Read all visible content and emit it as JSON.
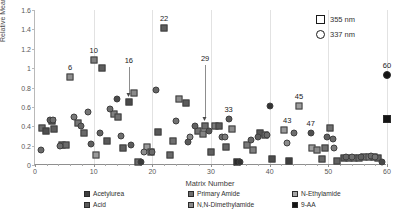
{
  "chart_data": {
    "type": "scatter",
    "title": "",
    "xlabel": "Matrix Number",
    "ylabel": "Relative Mean S/N Ratio",
    "xlim": [
      0,
      60
    ],
    "ylim": [
      0,
      1.6
    ],
    "xticks": [
      0,
      10,
      20,
      30,
      40,
      50,
      60
    ],
    "yticks": [
      "0",
      "0.2",
      "0.4",
      "0.6",
      "0.8",
      "1",
      "1.2",
      "1.4",
      "1.6"
    ],
    "grid": "vertical",
    "legend_position": "bottom",
    "wavelength_legend": [
      {
        "label": "355 nm",
        "marker": "square-open"
      },
      {
        "label": "337 nm",
        "marker": "circle-open"
      }
    ],
    "series": [
      {
        "name": "Acetylurea",
        "marker": "square",
        "color": "#3f3f3f"
      },
      {
        "name": "Acid",
        "marker": "square",
        "color": "#595959"
      },
      {
        "name": "Primary Amide",
        "marker": "square",
        "color": "#6e6e6e"
      },
      {
        "name": "N,N-Dimethylamide",
        "marker": "square",
        "color": "#8a8a8a"
      },
      {
        "name": "N-Ethylamide",
        "marker": "square",
        "color": "#a6a6a6"
      },
      {
        "name": "9-AA",
        "marker": "square",
        "color": "#141414"
      }
    ],
    "annotations": [
      {
        "label": "6",
        "x": 6,
        "y": 0.91
      },
      {
        "label": "10",
        "x": 10,
        "y": 1.08
      },
      {
        "label": "16",
        "x": 16,
        "y": 0.655
      },
      {
        "label": "22",
        "x": 22,
        "y": 1.41
      },
      {
        "label": "29",
        "x": 29,
        "y": 0.4
      },
      {
        "label": "33",
        "x": 33,
        "y": 0.47
      },
      {
        "label": "43",
        "x": 43,
        "y": 0.36
      },
      {
        "label": "45",
        "x": 45,
        "y": 0.61
      },
      {
        "label": "47",
        "x": 47,
        "y": 0.33
      },
      {
        "label": "60",
        "x": 60,
        "y": 0.93
      }
    ],
    "points_355nm": [
      {
        "x": 1.2,
        "y": 0.38,
        "c": "#6e6e6e"
      },
      {
        "x": 1.9,
        "y": 0.35,
        "c": "#4f4f4f"
      },
      {
        "x": 2.9,
        "y": 0.455,
        "c": "#555555"
      },
      {
        "x": 3.3,
        "y": 0.375,
        "c": "#5c5c5c"
      },
      {
        "x": 4.6,
        "y": 0.205,
        "c": "#5a5a5a"
      },
      {
        "x": 5.2,
        "y": 0.205,
        "c": "#6a6a6a"
      },
      {
        "x": 6.0,
        "y": 0.91,
        "c": "#8f8f8f"
      },
      {
        "x": 7.3,
        "y": 0.435,
        "c": "#777777"
      },
      {
        "x": 8.3,
        "y": 0.335,
        "c": "#696969"
      },
      {
        "x": 10.0,
        "y": 1.08,
        "c": "#808080"
      },
      {
        "x": 11.5,
        "y": 1.0,
        "c": "#5e5e5e"
      },
      {
        "x": 10.4,
        "y": 0.1,
        "c": "#9a9a9a"
      },
      {
        "x": 13.4,
        "y": 0.525,
        "c": "#808080"
      },
      {
        "x": 14.1,
        "y": 0.495,
        "c": "#707070"
      },
      {
        "x": 16.0,
        "y": 0.655,
        "c": "#4a4a4a"
      },
      {
        "x": 16.8,
        "y": 0.745,
        "c": "#8a8a8a"
      },
      {
        "x": 12.3,
        "y": 0.245,
        "c": "#5a5a5a"
      },
      {
        "x": 15.0,
        "y": 0.175,
        "c": "#606060"
      },
      {
        "x": 17.6,
        "y": 0.035,
        "c": "#6b6b6b"
      },
      {
        "x": 19.1,
        "y": 0.19,
        "c": "#9b9b9b"
      },
      {
        "x": 19.8,
        "y": 0.135,
        "c": "#6e6e6e"
      },
      {
        "x": 21.0,
        "y": 0.34,
        "c": "#585858"
      },
      {
        "x": 22.0,
        "y": 1.41,
        "c": "#5f5f5f"
      },
      {
        "x": 23.5,
        "y": 0.245,
        "c": "#707070"
      },
      {
        "x": 24.5,
        "y": 0.685,
        "c": "#8d8d8d"
      },
      {
        "x": 25.8,
        "y": 0.635,
        "c": "#5b5b5b"
      },
      {
        "x": 23.0,
        "y": 0.1,
        "c": "#6a6a6a"
      },
      {
        "x": 27.8,
        "y": 0.355,
        "c": "#737373"
      },
      {
        "x": 28.6,
        "y": 0.325,
        "c": "#838383"
      },
      {
        "x": 29.0,
        "y": 0.4,
        "c": "#6d6d6d"
      },
      {
        "x": 30.6,
        "y": 0.405,
        "c": "#7c7c7c"
      },
      {
        "x": 31.3,
        "y": 0.4,
        "c": "#5c5c5c"
      },
      {
        "x": 30.0,
        "y": 0.135,
        "c": "#606060"
      },
      {
        "x": 32.6,
        "y": 0.185,
        "c": "#666666"
      },
      {
        "x": 33.6,
        "y": 0.375,
        "c": "#8c8c8c"
      },
      {
        "x": 34.4,
        "y": 0.03,
        "c": "#2b2b2b"
      },
      {
        "x": 36.2,
        "y": 0.205,
        "c": "#7a7a7a"
      },
      {
        "x": 37.1,
        "y": 0.155,
        "c": "#808080"
      },
      {
        "x": 38.3,
        "y": 0.335,
        "c": "#555555"
      },
      {
        "x": 39.2,
        "y": 0.305,
        "c": "#6b6b6b"
      },
      {
        "x": 40.4,
        "y": 0.065,
        "c": "#4d4d4d"
      },
      {
        "x": 42.5,
        "y": 0.36,
        "c": "#9a9a9a"
      },
      {
        "x": 43.3,
        "y": 0.045,
        "c": "#3f3f3f"
      },
      {
        "x": 45.0,
        "y": 0.61,
        "c": "#9e9e9e"
      },
      {
        "x": 47.3,
        "y": 0.18,
        "c": "#a0a0a0"
      },
      {
        "x": 48.1,
        "y": 0.16,
        "c": "#8b8b8b"
      },
      {
        "x": 48.9,
        "y": 0.06,
        "c": "#686868"
      },
      {
        "x": 49.4,
        "y": 0.175,
        "c": "#6f6f6f"
      },
      {
        "x": 50.3,
        "y": 0.385,
        "c": "#707070"
      },
      {
        "x": 51.4,
        "y": 0.04,
        "c": "#626262"
      },
      {
        "x": 52.6,
        "y": 0.075,
        "c": "#5d5d5d"
      },
      {
        "x": 53.6,
        "y": 0.075,
        "c": "#6c6c6c"
      },
      {
        "x": 54.4,
        "y": 0.075,
        "c": "#777777"
      },
      {
        "x": 55.2,
        "y": 0.075,
        "c": "#6a6a6a"
      },
      {
        "x": 56.0,
        "y": 0.08,
        "c": "#737373"
      },
      {
        "x": 56.9,
        "y": 0.08,
        "c": "#7d7d7d"
      },
      {
        "x": 57.7,
        "y": 0.085,
        "c": "#686868"
      },
      {
        "x": 58.5,
        "y": 0.075,
        "c": "#606060"
      },
      {
        "x": 60.0,
        "y": 0.475,
        "c": "#141414"
      }
    ],
    "points_337nm": [
      {
        "x": 1.0,
        "y": 0.155,
        "c": "#6a6a6a"
      },
      {
        "x": 2.6,
        "y": 0.465,
        "c": "#5d5d5d"
      },
      {
        "x": 3.1,
        "y": 0.465,
        "c": "#707070"
      },
      {
        "x": 4.2,
        "y": 0.2,
        "c": "#6e6e6e"
      },
      {
        "x": 6.6,
        "y": 0.495,
        "c": "#787878"
      },
      {
        "x": 7.8,
        "y": 0.4,
        "c": "#646464"
      },
      {
        "x": 9.1,
        "y": 0.545,
        "c": "#767676"
      },
      {
        "x": 9.6,
        "y": 0.215,
        "c": "#5f5f5f"
      },
      {
        "x": 12.8,
        "y": 0.58,
        "c": "#6d6d6d"
      },
      {
        "x": 13.9,
        "y": 0.68,
        "c": "#4a4a4a"
      },
      {
        "x": 11.0,
        "y": 0.335,
        "c": "#636363"
      },
      {
        "x": 14.6,
        "y": 0.3,
        "c": "#6f6f6f"
      },
      {
        "x": 16.4,
        "y": 0.21,
        "c": "#5b5b5b"
      },
      {
        "x": 18.0,
        "y": 0.03,
        "c": "#3a3a3a"
      },
      {
        "x": 18.6,
        "y": 0.135,
        "c": "#8c8c8c"
      },
      {
        "x": 20.6,
        "y": 0.775,
        "c": "#666666"
      },
      {
        "x": 20.0,
        "y": 0.135,
        "c": "#6b6b6b"
      },
      {
        "x": 24.0,
        "y": 0.455,
        "c": "#727272"
      },
      {
        "x": 26.4,
        "y": 0.285,
        "c": "#8a8a8a"
      },
      {
        "x": 26.0,
        "y": 0.24,
        "c": "#5a5a5a"
      },
      {
        "x": 27.2,
        "y": 0.4,
        "c": "#606060"
      },
      {
        "x": 29.6,
        "y": 0.355,
        "c": "#585858"
      },
      {
        "x": 31.9,
        "y": 0.285,
        "c": "#6e6e6e"
      },
      {
        "x": 32.4,
        "y": 0.285,
        "c": "#7a7a7a"
      },
      {
        "x": 33.0,
        "y": 0.47,
        "c": "#5c5c5c"
      },
      {
        "x": 35.0,
        "y": 0.03,
        "c": "#333333"
      },
      {
        "x": 36.8,
        "y": 0.255,
        "c": "#666666"
      },
      {
        "x": 38.0,
        "y": 0.29,
        "c": "#5e5e5e"
      },
      {
        "x": 39.6,
        "y": 0.31,
        "c": "#6c6c6c"
      },
      {
        "x": 40.0,
        "y": 0.61,
        "c": "#333333"
      },
      {
        "x": 43.0,
        "y": 0.225,
        "c": "#8b8b8b"
      },
      {
        "x": 44.2,
        "y": 0.33,
        "c": "#6d6d6d"
      },
      {
        "x": 47.0,
        "y": 0.33,
        "c": "#4f4f4f"
      },
      {
        "x": 49.8,
        "y": 0.29,
        "c": "#5f5f5f"
      },
      {
        "x": 50.8,
        "y": 0.265,
        "c": "#6a6a6a"
      },
      {
        "x": 51.0,
        "y": 0.175,
        "c": "#7b7b7b"
      },
      {
        "x": 53.0,
        "y": 0.08,
        "c": "#666666"
      },
      {
        "x": 54.0,
        "y": 0.085,
        "c": "#6f6f6f"
      },
      {
        "x": 55.6,
        "y": 0.085,
        "c": "#606060"
      },
      {
        "x": 57.2,
        "y": 0.09,
        "c": "#6b6b6b"
      },
      {
        "x": 58.0,
        "y": 0.085,
        "c": "#757575"
      },
      {
        "x": 59.2,
        "y": 0.03,
        "c": "#4a4a4a"
      },
      {
        "x": 60.0,
        "y": 0.93,
        "c": "#141414"
      }
    ]
  }
}
